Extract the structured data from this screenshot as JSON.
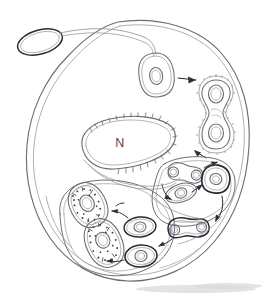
{
  "figure": {
    "kind": "hand-drawn-biology-diagram",
    "background_color": "#ffffff",
    "ink_color": "#3f3f46",
    "faint_ink_color": "#9a9aa2",
    "dark_ink_color": "#2a2a2e"
  },
  "labels": [
    {
      "id": "nucleus",
      "text": "N",
      "x": 120,
      "y": 143,
      "meaning": "host cell nucleus"
    }
  ],
  "structures": {
    "host_cell": {
      "name": "host-cell-outline",
      "description": "large irregular rounded outline occupying most of the frame"
    },
    "external_body": {
      "name": "external-oval-body",
      "description": "small oval at upper-left outside the host cell, joined by a slender stalk"
    },
    "nucleus": {
      "name": "host-nucleus",
      "description": "elongated oval with stippled / hatched rim, labelled N"
    },
    "vacuole_upper": {
      "name": "vacuole-upper",
      "description": "rounded compartment at upper middle containing a single cell with one nucleus"
    },
    "dividing_cell": {
      "name": "dividing-cell-dumbbell",
      "description": "figure-eight cell with two nuclei enclosed in a stippled vacuole, upper right"
    },
    "vacuole_right": {
      "name": "vacuole-right-cluster",
      "description": "compartment at mid-right holding dumbbell and single cells"
    },
    "vacuole_lower_left": {
      "name": "vacuole-lower-left-digestive",
      "description": "compartment at lower left containing two granular, degrading cells"
    },
    "digesting_cells": {
      "name": "degrading-cells",
      "description": "two stippled cells with dense granular contents undergoing digestion"
    }
  },
  "cells": [
    {
      "id": "cell-entry",
      "label": "",
      "type": "single-nucleus",
      "cx": 156,
      "cy": 75,
      "rx": 17,
      "ry": 22,
      "rotation": -8,
      "nucleus_rx": 6,
      "nucleus_ry": 8,
      "membrane": "plain",
      "state": "intact"
    },
    {
      "id": "cell-dividing-top",
      "label": "",
      "type": "dumbbell-two-nuclei",
      "cx": 217,
      "cy": 105,
      "state": "dividing",
      "membrane": "stippled-vacuole"
    },
    {
      "id": "cell-pair-mid",
      "label": "",
      "type": "dumbbell-two-nuclei",
      "cx": 180,
      "cy": 172,
      "state": "dividing",
      "membrane": "plain"
    },
    {
      "id": "cell-single-mid",
      "label": "",
      "type": "single-nucleus",
      "cx": 180,
      "cy": 192,
      "state": "intact",
      "membrane": "plain"
    },
    {
      "id": "cell-dark-right",
      "label": "",
      "type": "single-nucleus",
      "cx": 216,
      "cy": 178,
      "state": "condensing",
      "membrane": "dark"
    },
    {
      "id": "cell-pair-bottom",
      "label": "",
      "type": "dumbbell-two-nuclei",
      "cx": 185,
      "cy": 228,
      "state": "dividing",
      "membrane": "dark"
    },
    {
      "id": "cell-single-bottom-mid",
      "label": "",
      "type": "single-nucleus",
      "cx": 140,
      "cy": 227,
      "state": "intact",
      "membrane": "dark"
    },
    {
      "id": "cell-single-bottom-low",
      "label": "",
      "type": "single-nucleus",
      "cx": 141,
      "cy": 256,
      "state": "intact",
      "membrane": "dark"
    },
    {
      "id": "cell-degrading-upper",
      "label": "",
      "type": "granular-degrading",
      "cx": 88,
      "cy": 205,
      "state": "degrading",
      "membrane": "stippled"
    },
    {
      "id": "cell-degrading-lower",
      "label": "",
      "type": "granular-degrading",
      "cx": 104,
      "cy": 243,
      "state": "degrading",
      "membrane": "stippled"
    }
  ],
  "arrows": [
    {
      "id": "arrow-entry-to-dividing",
      "from": "cell-entry",
      "to": "cell-dividing-top",
      "direction": "right"
    },
    {
      "id": "arrow-dividing-to-vacuole",
      "from": "cell-dividing-top",
      "to": "vacuole-right-cluster",
      "direction": "down-left"
    },
    {
      "id": "arrow-right-cluster-down",
      "from": "cell-dark-right",
      "to": "cell-pair-bottom",
      "direction": "down"
    },
    {
      "id": "arrow-pair-to-single-bottom",
      "from": "cell-pair-bottom",
      "to": "cell-single-bottom-mid",
      "direction": "left"
    },
    {
      "id": "arrow-single-to-degrading-upper",
      "from": "cell-single-bottom-mid",
      "to": "cell-degrading-upper",
      "direction": "left"
    },
    {
      "id": "arrow-single-low-to-degrading-lower",
      "from": "cell-single-bottom-low",
      "to": "cell-degrading-lower",
      "direction": "left"
    },
    {
      "id": "arrow-internal-right-a",
      "from": "cell-single-mid",
      "to": "cell-dark-right",
      "direction": "right"
    },
    {
      "id": "arrow-internal-right-b",
      "from": "cell-pair-mid",
      "to": "cell-dark-right",
      "direction": "right"
    }
  ]
}
